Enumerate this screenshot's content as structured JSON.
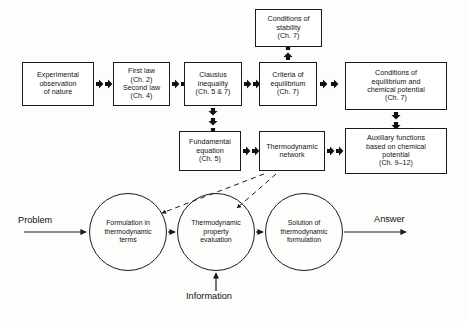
{
  "diagram": {
    "type": "flow-diagram",
    "colors": {
      "line": "#1a1a1a",
      "box_fill": "#ffffff",
      "background": "#fdfdfb"
    },
    "upper_flow": {
      "boxes": [
        {
          "id": "experimental-observation",
          "text": "Experimental\nobservation\nof nature",
          "x": 22,
          "y": 62,
          "w": 72,
          "h": 44
        },
        {
          "id": "first-second-law",
          "text": "First law\n(Ch. 2)\nSecond law\n(Ch. 4)",
          "x": 113,
          "y": 62,
          "w": 57,
          "h": 44
        },
        {
          "id": "clausius-inequality",
          "text": "Clausius\ninequality\n(Ch. 5 & 7)",
          "x": 184,
          "y": 62,
          "w": 58,
          "h": 44
        },
        {
          "id": "criteria-of-equilibrium",
          "text": "Criteria of\nequilibrium\n(Ch. 7)",
          "x": 259,
          "y": 62,
          "w": 58,
          "h": 44
        },
        {
          "id": "conditions-of-stability",
          "text": "Conditions of\nstability\n(Ch. 7)",
          "x": 255,
          "y": 9,
          "w": 67,
          "h": 38
        },
        {
          "id": "conditions-of-equilibrium-chemical-potential",
          "text": "Conditions of\nequilibrium and\nchemical potential\n(Ch. 7)",
          "x": 345,
          "y": 62,
          "w": 102,
          "h": 48
        },
        {
          "id": "fundamental-equation",
          "text": "Fundamental\nequation\n(Ch. 5)",
          "x": 179,
          "y": 131,
          "w": 62,
          "h": 40
        },
        {
          "id": "thermodynamic-network",
          "text": "Thermodynamic\nnetwork",
          "x": 259,
          "y": 131,
          "w": 66,
          "h": 40
        },
        {
          "id": "auxillary-functions",
          "text": "Auxillary functions\nbased on chemical\npotential\n(Ch. 9–12)",
          "x": 345,
          "y": 128,
          "w": 102,
          "h": 46
        }
      ]
    },
    "lower_flow": {
      "circles": [
        {
          "id": "formulation-in-thermodynamic-terms",
          "text": "Formulation in\nthermodynamic\nterms",
          "cx": 128,
          "cy": 232,
          "r": 39
        },
        {
          "id": "thermodynamic-property-evaluation",
          "text": "Thermodynamic\nproperty\nevaluation",
          "cx": 216,
          "cy": 232,
          "r": 39
        },
        {
          "id": "solution-of-thermodynamic-formulation",
          "text": "Solution of\nthermodynamic\nformulation",
          "cx": 304,
          "cy": 232,
          "r": 39
        }
      ],
      "labels": {
        "problem": "Problem",
        "answer": "Answer",
        "information": "Information"
      }
    },
    "connections": [
      {
        "from": "experimental-observation",
        "to": "first-second-law",
        "style": "double-arrowhead",
        "direction": "right"
      },
      {
        "from": "first-second-law",
        "to": "clausius-inequality",
        "style": "double-arrowhead",
        "direction": "right"
      },
      {
        "from": "clausius-inequality",
        "to": "criteria-of-equilibrium",
        "style": "double-arrowhead",
        "direction": "right"
      },
      {
        "from": "criteria-of-equilibrium",
        "to": "conditions-of-stability",
        "style": "double-arrowhead",
        "direction": "up"
      },
      {
        "from": "criteria-of-equilibrium",
        "to": "conditions-of-equilibrium-chemical-potential",
        "style": "double-arrowhead",
        "direction": "right"
      },
      {
        "from": "clausius-inequality",
        "to": "fundamental-equation",
        "style": "triple-arrowhead",
        "direction": "down"
      },
      {
        "from": "fundamental-equation",
        "to": "thermodynamic-network",
        "style": "double-arrowhead",
        "direction": "right"
      },
      {
        "from": "thermodynamic-network",
        "to": "auxillary-functions",
        "style": "double-arrowhead",
        "direction": "right"
      },
      {
        "from": "conditions-of-equilibrium-chemical-potential",
        "to": "auxillary-functions",
        "style": "double-arrowhead",
        "direction": "down"
      },
      {
        "from": "problem",
        "to": "formulation-in-thermodynamic-terms",
        "style": "solid-arrow",
        "direction": "right"
      },
      {
        "from": "formulation-in-thermodynamic-terms",
        "to": "thermodynamic-property-evaluation",
        "style": "solid-arrow",
        "direction": "right"
      },
      {
        "from": "thermodynamic-property-evaluation",
        "to": "solution-of-thermodynamic-formulation",
        "style": "solid-arrow",
        "direction": "right"
      },
      {
        "from": "solution-of-thermodynamic-formulation",
        "to": "answer",
        "style": "solid-arrow",
        "direction": "right"
      },
      {
        "from": "information",
        "to": "thermodynamic-property-evaluation",
        "style": "solid-arrow",
        "direction": "up"
      },
      {
        "from": "thermodynamic-network",
        "to": "formulation-in-thermodynamic-terms",
        "style": "dashed-arrow",
        "direction": "down-left"
      },
      {
        "from": "thermodynamic-network",
        "to": "thermodynamic-property-evaluation",
        "style": "dashed-arrow",
        "direction": "down-left"
      }
    ]
  }
}
